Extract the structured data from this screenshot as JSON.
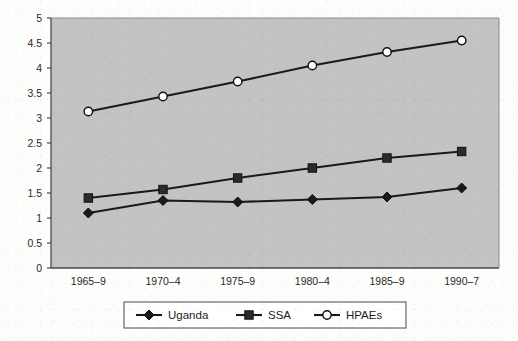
{
  "chart_data": {
    "type": "line",
    "title": "",
    "subtitle": "",
    "xlabel": "",
    "ylabel": "",
    "categories": [
      "1965–9",
      "1970–4",
      "1975–9",
      "1980–4",
      "1985–9",
      "1990–7"
    ],
    "series": [
      {
        "name": "Uganda",
        "marker": "diamond",
        "marker_fill": "#1a1a1a",
        "line_color": "#1a1a1a",
        "values": [
          1.1,
          1.35,
          1.32,
          1.37,
          1.42,
          1.6
        ]
      },
      {
        "name": "SSA",
        "marker": "square",
        "marker_fill": "#2b2b2b",
        "line_color": "#1a1a1a",
        "values": [
          1.4,
          1.57,
          1.8,
          2.0,
          2.2,
          2.33
        ]
      },
      {
        "name": "HPAEs",
        "marker": "circle",
        "marker_fill": "#ffffff",
        "line_color": "#1a1a1a",
        "values": [
          3.13,
          3.43,
          3.73,
          4.05,
          4.32,
          4.55
        ]
      }
    ],
    "ylim": [
      0,
      5
    ],
    "ytick_step": 0.5,
    "ytick_labels": [
      "0",
      "0.5",
      "1",
      "1.5",
      "2",
      "2.5",
      "3",
      "3.5",
      "4",
      "4.5",
      "5"
    ],
    "grid": false,
    "legend_position": "bottom",
    "plot_background": "#c3c3c3",
    "page_background": "#fdfdfc",
    "axis_color": "#4a4a4a"
  },
  "legend": {
    "items": [
      {
        "label": "Uganda",
        "marker": "diamond"
      },
      {
        "label": "SSA",
        "marker": "square"
      },
      {
        "label": "HPAEs",
        "marker": "circle"
      }
    ]
  }
}
